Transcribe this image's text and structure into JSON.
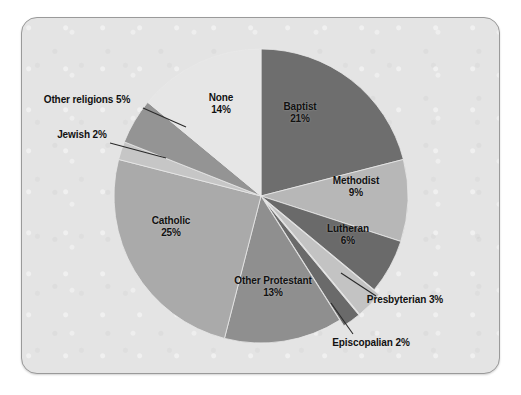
{
  "chart_data": {
    "type": "pie",
    "title": "",
    "subtitle": "",
    "xlabel": "",
    "ylabel": "",
    "legend_position": "none",
    "grid": false,
    "units": "%",
    "total": 100,
    "start_angle_deg": 0,
    "direction": "clockwise",
    "categories": [
      "Baptist",
      "Methodist",
      "Lutheran",
      "Presbyterian",
      "Episcopalian",
      "Other Protestant",
      "Catholic",
      "Jewish",
      "Other religions",
      "None"
    ],
    "values": [
      21,
      9,
      6,
      3,
      2,
      13,
      25,
      2,
      5,
      14
    ],
    "slices": [
      {
        "label": "Baptist",
        "value": 21,
        "pct_text": "21%",
        "color": "#6e6e6e",
        "exploded": false,
        "label_placement": "inside",
        "label_x": 300,
        "label_y": 112
      },
      {
        "label": "Methodist",
        "value": 9,
        "pct_text": "9%",
        "color": "#b7b7b7",
        "exploded": false,
        "label_placement": "inside",
        "label_y": 186,
        "label_x": 356
      },
      {
        "label": "Lutheran",
        "value": 6,
        "pct_text": "6%",
        "color": "#6a6a6a",
        "exploded": false,
        "label_placement": "inside",
        "label_x": 348,
        "label_y": 234
      },
      {
        "label": "Presbyterian",
        "value": 3,
        "pct_text": "3%",
        "color": "#c3c3c3",
        "exploded": true,
        "label_placement": "callout",
        "label_x": 405,
        "label_y": 300
      },
      {
        "label": "Episcopalian",
        "value": 2,
        "pct_text": "2%",
        "color": "#6a6a6a",
        "exploded": true,
        "label_placement": "callout",
        "label_x": 371,
        "label_y": 343
      },
      {
        "label": "Other Protestant",
        "value": 13,
        "pct_text": "13%",
        "color": "#8f8f8f",
        "exploded": false,
        "label_placement": "inside",
        "label_x": 273,
        "label_y": 286
      },
      {
        "label": "Catholic",
        "value": 25,
        "pct_text": "25%",
        "color": "#aaaaaa",
        "exploded": false,
        "label_placement": "inside",
        "label_x": 171,
        "label_y": 226
      },
      {
        "label": "Jewish",
        "value": 2,
        "pct_text": "2%",
        "color": "#c6c6c6",
        "exploded": false,
        "label_placement": "callout",
        "label_x": 82,
        "label_y": 135
      },
      {
        "label": "Other religions",
        "value": 5,
        "pct_text": "5%",
        "color": "#949494",
        "exploded": false,
        "label_placement": "callout",
        "label_x": 87,
        "label_y": 100
      },
      {
        "label": "None",
        "value": 14,
        "pct_text": "14%",
        "color": "#e6e6e6",
        "exploded": false,
        "label_placement": "inside",
        "label_x": 221,
        "label_y": 103
      }
    ],
    "geometry": {
      "center_x": 261,
      "center_y": 196,
      "radius": 147
    },
    "style": {
      "panel_background": "#e4e4e4",
      "panel_border": "#9a9a9a",
      "page_background": "#ffffff",
      "label_color": "#111111",
      "leader_line_color": "#2a2a2a",
      "slice_separator": "#e9e9e9"
    }
  }
}
